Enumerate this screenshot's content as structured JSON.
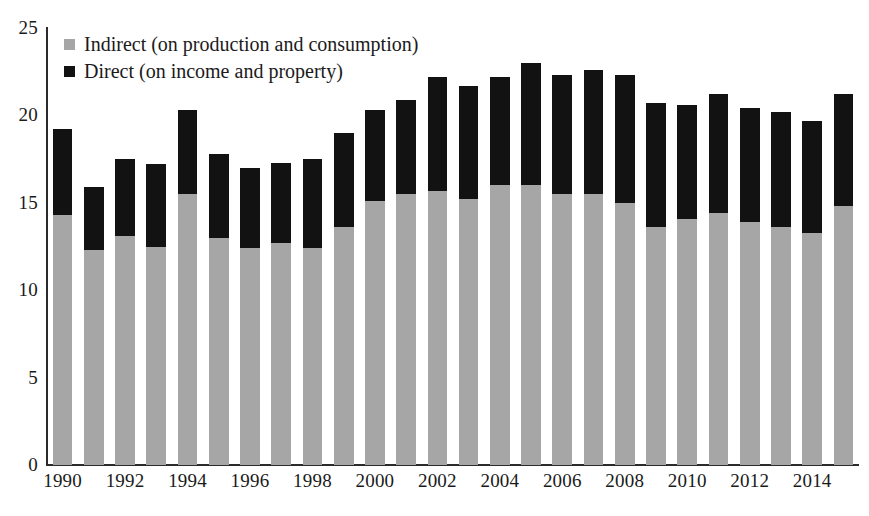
{
  "chart_data": {
    "type": "bar",
    "stacked": true,
    "title": "",
    "subtitle": "",
    "xlabel": "",
    "ylabel": "",
    "grid": false,
    "legend_position": "top-left",
    "ylim": [
      0,
      25
    ],
    "yticks": [
      0,
      5,
      10,
      15,
      20,
      25
    ],
    "ytick_labels": [
      "0",
      "5",
      "10",
      "15",
      "20",
      "25"
    ],
    "categories": [
      "1990",
      "1991",
      "1992",
      "1993",
      "1994",
      "1995",
      "1996",
      "1997",
      "1998",
      "1999",
      "2000",
      "2001",
      "2002",
      "2003",
      "2004",
      "2005",
      "2006",
      "2007",
      "2008",
      "2009",
      "2010",
      "2011",
      "2012",
      "2013",
      "2014",
      "2015"
    ],
    "xtick_labels": [
      "1990",
      "1992",
      "1994",
      "1996",
      "1998",
      "2000",
      "2002",
      "2004",
      "2006",
      "2008",
      "2010",
      "2012",
      "2014"
    ],
    "xtick_categories": [
      "1990",
      "1992",
      "1994",
      "1996",
      "1998",
      "2000",
      "2002",
      "2004",
      "2006",
      "2008",
      "2010",
      "2012",
      "2014"
    ],
    "series": [
      {
        "name": "Indirect (on production and consumption)",
        "color": "#a6a6a6",
        "values": [
          14.3,
          12.3,
          13.1,
          12.5,
          15.5,
          13.0,
          12.4,
          12.7,
          12.4,
          13.6,
          15.1,
          15.5,
          15.7,
          15.2,
          16.0,
          16.0,
          15.5,
          15.5,
          15.0,
          13.6,
          14.1,
          14.4,
          13.9,
          13.6,
          13.3,
          14.8
        ]
      },
      {
        "name": "Direct (on income and property)",
        "color": "#121212",
        "values": [
          4.9,
          3.6,
          4.4,
          4.7,
          4.8,
          4.8,
          4.6,
          4.6,
          5.1,
          5.4,
          5.2,
          5.4,
          6.5,
          6.5,
          6.2,
          7.0,
          6.8,
          7.1,
          7.3,
          7.1,
          6.5,
          6.8,
          6.5,
          6.6,
          6.4,
          6.4
        ]
      }
    ],
    "totals": [
      19.2,
      15.9,
      17.5,
      17.2,
      20.3,
      17.8,
      17.0,
      17.3,
      17.5,
      19.0,
      20.3,
      20.9,
      22.2,
      21.7,
      22.2,
      23.0,
      22.3,
      22.6,
      22.3,
      20.7,
      20.6,
      21.2,
      20.4,
      20.2,
      19.7,
      21.2
    ]
  },
  "legend": {
    "items": [
      {
        "label": "Indirect (on production and consumption)",
        "color": "#a6a6a6"
      },
      {
        "label": "Direct (on income and property)",
        "color": "#121212"
      }
    ]
  }
}
